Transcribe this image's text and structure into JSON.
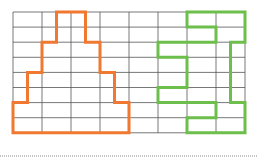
{
  "diagram": {
    "grid": {
      "origin_x": 13,
      "origin_y": 12,
      "columns": 8,
      "rows": 8,
      "cell_width": 29,
      "cell_height": 15.1,
      "line_color": "#555555"
    },
    "half_unit_x": 14.5,
    "shapes": [
      {
        "name": "orange-stepped-pyramid",
        "color": "#f07830",
        "points_units": [
          [
            3,
            0
          ],
          [
            5,
            0
          ],
          [
            5,
            2
          ],
          [
            6,
            2
          ],
          [
            6,
            4
          ],
          [
            7,
            4
          ],
          [
            7,
            6
          ],
          [
            8,
            6
          ],
          [
            8,
            8
          ],
          [
            0,
            8
          ],
          [
            0,
            6
          ],
          [
            1,
            6
          ],
          [
            1,
            4
          ],
          [
            2,
            4
          ],
          [
            2,
            2
          ],
          [
            3,
            2
          ]
        ]
      },
      {
        "name": "green-interlocking-figure",
        "color": "#6cbf4a",
        "points_units": [
          [
            12,
            0
          ],
          [
            16,
            0
          ],
          [
            16,
            2
          ],
          [
            15,
            2
          ],
          [
            15,
            6
          ],
          [
            16,
            6
          ],
          [
            16,
            8
          ],
          [
            12,
            8
          ],
          [
            12,
            7
          ],
          [
            14,
            7
          ],
          [
            14,
            6
          ],
          [
            10,
            6
          ],
          [
            10,
            5
          ],
          [
            12,
            5
          ],
          [
            12,
            3
          ],
          [
            10,
            3
          ],
          [
            10,
            2
          ],
          [
            14,
            2
          ],
          [
            14,
            1
          ],
          [
            12,
            1
          ]
        ]
      }
    ],
    "baseline": {
      "style": "dotted",
      "y": 156,
      "x_start": 0,
      "x_end": 258,
      "color": "#888888"
    }
  }
}
